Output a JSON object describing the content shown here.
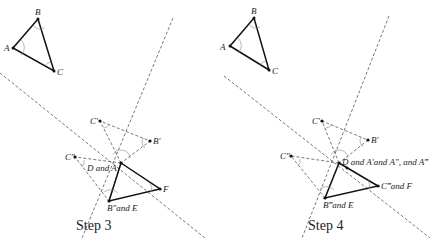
{
  "panels": [
    {
      "caption": "Step 3",
      "labels": {
        "A": "A",
        "B": "B",
        "C": "C",
        "C1": "C′",
        "B1": "B′",
        "C2": "C″",
        "D": "D and A",
        "F": "F",
        "E": "B″and E"
      }
    },
    {
      "caption": "Step 4",
      "labels": {
        "A": "A",
        "B": "B",
        "C": "C",
        "C1": "C′",
        "B1": "B′",
        "C2": "C″",
        "D": "D and A′and A″, and A‴",
        "F": "C‴and F",
        "E": "B‴and E"
      }
    }
  ],
  "colors": {
    "line": "#111111",
    "dashed": "#555555",
    "arc": "#888888"
  }
}
